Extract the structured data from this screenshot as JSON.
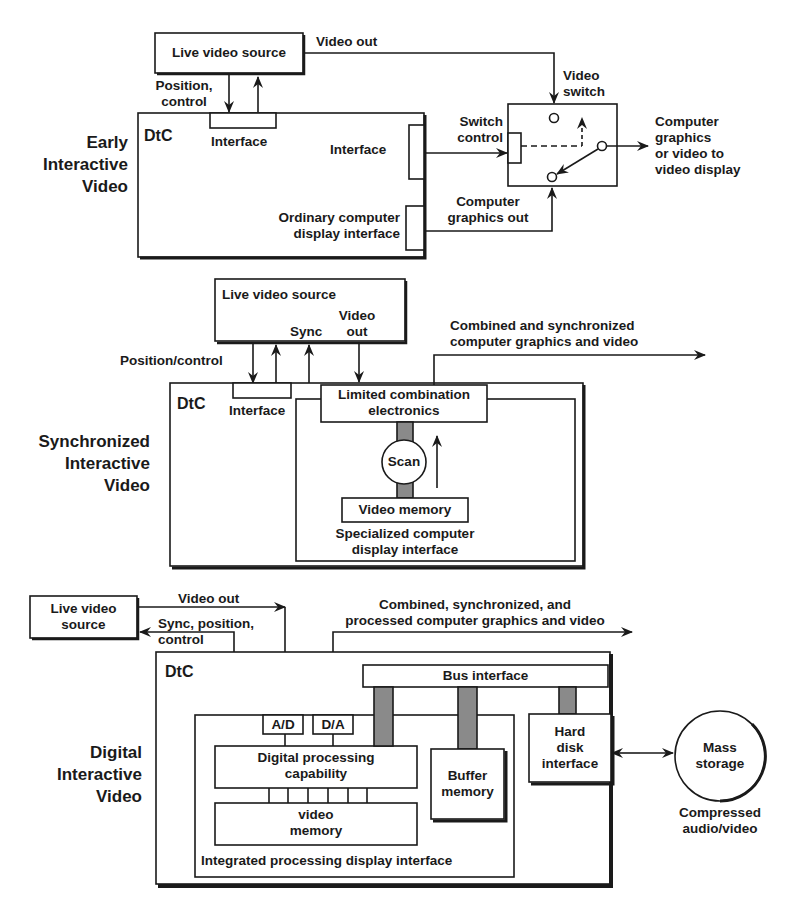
{
  "panels": [
    {
      "title": "Early Interactive Video",
      "title_lines": [
        "Early",
        "Interactive",
        "Video"
      ],
      "computer_label": "DtC",
      "live_source_label": "Live video source",
      "video_out_label": "Video out",
      "position_control_lines": [
        "Position,",
        "control"
      ],
      "interface_top_label": "Interface",
      "interface_right_label": "Interface",
      "display_interface_lines": [
        "Ordinary computer",
        "display interface"
      ],
      "switch_control_lines": [
        "Switch",
        "control"
      ],
      "graphics_out_lines": [
        "Computer",
        "graphics out"
      ],
      "video_switch_lines": [
        "Video",
        "switch"
      ],
      "output_lines": [
        "Computer",
        "graphics",
        "or video to",
        "video display"
      ]
    },
    {
      "title": "Synchronized Interactive Video",
      "title_lines": [
        "Synchronized",
        "Interactive",
        "Video"
      ],
      "computer_label": "DtC",
      "live_source_label": "Live video source",
      "sync_label": "Sync",
      "video_out_lines": [
        "Video",
        "out"
      ],
      "position_control_label": "Position/control",
      "interface_label": "Interface",
      "combination_lines": [
        "Limited combination",
        "electronics"
      ],
      "scan_label": "Scan",
      "video_memory_label": "Video memory",
      "display_interface_lines": [
        "Specialized computer",
        "display interface"
      ],
      "output_lines": [
        "Combined and synchronized",
        "computer graphics and video"
      ]
    },
    {
      "title": "Digital Interactive Video",
      "title_lines": [
        "Digital",
        "Interactive",
        "Video"
      ],
      "computer_label": "DtC",
      "live_source_lines": [
        "Live video",
        "source"
      ],
      "video_out_label": "Video out",
      "sync_position_lines": [
        "Sync, position,",
        "control"
      ],
      "output_lines": [
        "Combined, synchronized, and",
        "processed computer graphics and video"
      ],
      "bus_interface_label": "Bus interface",
      "ad_label": "A/D",
      "da_label": "D/A",
      "digital_processing_lines": [
        "Digital processing",
        "capability"
      ],
      "video_memory_lines": [
        "video",
        "memory"
      ],
      "integrated_interface_label": "Integrated processing display interface",
      "buffer_memory_lines": [
        "Buffer",
        "memory"
      ],
      "hard_disk_lines": [
        "Hard",
        "disk",
        "interface"
      ],
      "mass_storage_lines": [
        "Mass",
        "storage"
      ],
      "compressed_lines": [
        "Compressed",
        "audio/video"
      ]
    }
  ],
  "colors": {
    "ink": "#1a1a1a",
    "bus_fill": "#8a8a8a",
    "background": "#ffffff"
  }
}
